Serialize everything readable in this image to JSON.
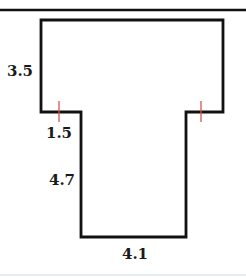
{
  "figure": {
    "type": "composite T-shaped polygon",
    "colors": {
      "outline": "#111111",
      "tick_marks": "#d9534f",
      "background": "#ffffff",
      "bottom_rule": "#e6ecf2"
    },
    "labels": {
      "top_left_height": "3.5",
      "ledge_width": "1.5",
      "stem_height": "4.7",
      "stem_bottom_width": "4.1"
    },
    "tick_marks": {
      "count": 2,
      "meaning": "equal-length segments (left ledge and right ledge)"
    }
  }
}
